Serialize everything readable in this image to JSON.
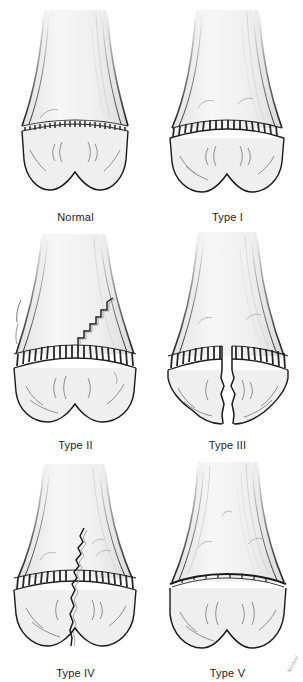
{
  "figure": {
    "background_color": "#ffffff",
    "ink_color": "#1a1a1a",
    "bone_fill_color": "#f2f2f2",
    "physis_color": "#2b2b2b",
    "signature": "Nordahl"
  },
  "panels": [
    {
      "id": "normal",
      "label": "Normal",
      "row": 1,
      "column": 1,
      "physis": "intact continuous wavy dark band",
      "fracture": "none",
      "description": "Intact distal long bone with diaphysis, flared metaphysis, continuous growth plate and bilobed epiphysis"
    },
    {
      "id": "type-1",
      "label": "Type I",
      "row": 1,
      "column": 2,
      "physis": "widened separated band",
      "fracture": "through physis only",
      "description": "Complete separation of the epiphysis through the growth plate without bone fracture"
    },
    {
      "id": "type-2",
      "label": "Type II",
      "row": 2,
      "column": 1,
      "physis": "intact band with fracture exiting superiorly",
      "fracture": "physis plus metaphyseal triangular fragment",
      "description": "Fracture through the physis exiting upward into the metaphysis, leaving a triangular metaphyseal fragment"
    },
    {
      "id": "type-3",
      "label": "Type III",
      "row": 2,
      "column": 2,
      "physis": "band split at midpoint",
      "fracture": "physis plus vertical epiphyseal split",
      "description": "Fracture through part of the physis then downward through the epiphysis into the joint, fragments separated"
    },
    {
      "id": "type-4",
      "label": "Type IV",
      "row": 3,
      "column": 1,
      "physis": "band crossed by vertical fracture",
      "fracture": "metaphysis, physis and epiphysis",
      "description": "Vertical fracture crossing the metaphysis, growth plate and epiphysis in one continuous line"
    },
    {
      "id": "type-5",
      "label": "Type V",
      "row": 3,
      "column": 2,
      "physis": "compressed thin dark line",
      "fracture": "crush injury of physis",
      "description": "Crush or compression injury of the growth plate with no displacement, physis appears narrowed"
    }
  ]
}
